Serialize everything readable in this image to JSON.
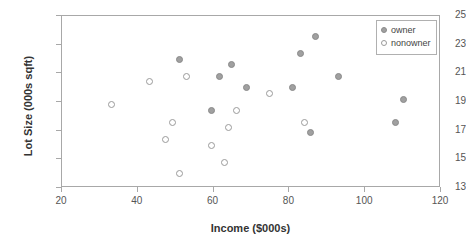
{
  "chart_data": {
    "type": "scatter",
    "title": "",
    "xlabel": "Income ($000s)",
    "ylabel": "Lot Size (000s sqft)",
    "xlim": [
      20,
      120
    ],
    "ylim": [
      13,
      25
    ],
    "xticks": [
      20,
      40,
      60,
      80,
      100,
      120
    ],
    "yticks": [
      13,
      15,
      17,
      19,
      21,
      23,
      25
    ],
    "grid": false,
    "legend_position": "top-right",
    "colors": {
      "owner_fill": "#a0a0a0",
      "owner_stroke": "#8a8a8a",
      "nonowner_fill": "#ffffff",
      "nonowner_stroke": "#9a9a9a",
      "axis": "#a8a8a8",
      "text": "#333333"
    },
    "series": [
      {
        "name": "owner",
        "marker": "filled-circle",
        "points": [
          {
            "x": 51.0,
            "y": 22.0
          },
          {
            "x": 59.4,
            "y": 18.4
          },
          {
            "x": 61.5,
            "y": 20.8
          },
          {
            "x": 64.8,
            "y": 21.6
          },
          {
            "x": 68.8,
            "y": 20.0
          },
          {
            "x": 80.9,
            "y": 20.0
          },
          {
            "x": 83.0,
            "y": 22.4
          },
          {
            "x": 85.5,
            "y": 16.9
          },
          {
            "x": 87.0,
            "y": 23.6
          },
          {
            "x": 93.0,
            "y": 20.8
          },
          {
            "x": 108.0,
            "y": 17.6
          },
          {
            "x": 110.1,
            "y": 19.2
          }
        ]
      },
      {
        "name": "nonowner",
        "marker": "open-circle",
        "points": [
          {
            "x": 33.0,
            "y": 18.8
          },
          {
            "x": 43.2,
            "y": 20.4
          },
          {
            "x": 47.4,
            "y": 16.4
          },
          {
            "x": 49.2,
            "y": 17.6
          },
          {
            "x": 51.0,
            "y": 14.0
          },
          {
            "x": 52.8,
            "y": 20.8
          },
          {
            "x": 59.4,
            "y": 16.0
          },
          {
            "x": 63.0,
            "y": 14.8
          },
          {
            "x": 64.0,
            "y": 17.2
          },
          {
            "x": 66.0,
            "y": 18.4
          },
          {
            "x": 74.8,
            "y": 19.6
          },
          {
            "x": 84.0,
            "y": 17.6
          }
        ]
      }
    ]
  },
  "legend": {
    "items": [
      {
        "label": "owner",
        "marker": "owner"
      },
      {
        "label": "nonowner",
        "marker": "nonowner"
      }
    ]
  }
}
